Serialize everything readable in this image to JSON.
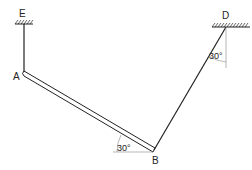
{
  "diagram": {
    "type": "mechanics-truss",
    "points": {
      "E": {
        "label": "E"
      },
      "A": {
        "label": "A"
      },
      "B": {
        "label": "B"
      },
      "D": {
        "label": "D"
      }
    },
    "angles": {
      "at_D": {
        "label": "30°",
        "reference": "vertical"
      },
      "at_B": {
        "label": "30°",
        "reference": "horizontal"
      }
    },
    "members": [
      {
        "from": "E",
        "to": "A",
        "style": "single-line rod"
      },
      {
        "from": "A",
        "to": "B",
        "style": "double-line bar"
      },
      {
        "from": "B",
        "to": "D",
        "style": "single-line rod"
      }
    ],
    "supports": [
      {
        "at": "E",
        "type": "fixed-ceiling"
      },
      {
        "at": "D",
        "type": "fixed-ceiling"
      }
    ],
    "colors": {
      "stroke": "#222222",
      "background": "#ffffff",
      "guide": "#888888"
    }
  }
}
